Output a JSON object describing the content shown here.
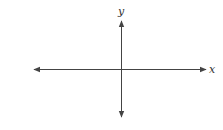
{
  "diagram": {
    "type": "coordinate-axes",
    "x_axis": {
      "label": "x",
      "y_position": 69,
      "x_start": 33,
      "x_end": 207,
      "arrows": "both"
    },
    "y_axis": {
      "label": "y",
      "x_position": 121,
      "y_start": 20,
      "y_end": 118,
      "arrows": "both"
    },
    "colors": {
      "axis": "#444444",
      "label": "#333333",
      "background": "#ffffff"
    }
  }
}
